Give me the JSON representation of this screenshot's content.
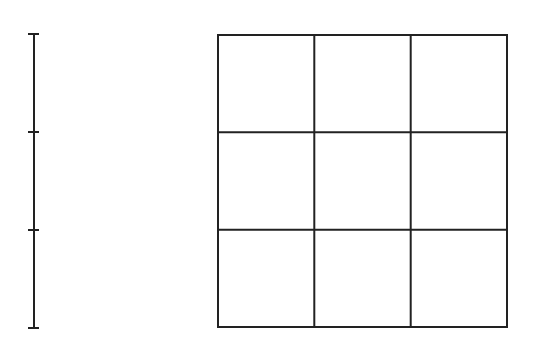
{
  "diagram": {
    "stroke_color": "#222222",
    "background": "#ffffff",
    "segment": {
      "x": 34,
      "y_start": 34,
      "y_end": 328,
      "ticks_y": [
        34,
        132,
        230,
        328
      ],
      "divisions": 3
    },
    "grid": {
      "x": 218,
      "y": 35,
      "width": 289,
      "height": 292,
      "rows": 3,
      "cols": 3
    }
  }
}
